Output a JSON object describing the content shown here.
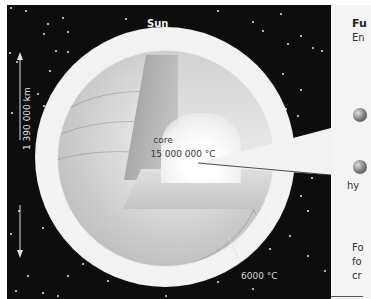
{
  "figure": {
    "title": "Sun",
    "diameter_label": "1 390 000 km",
    "core_label": "core",
    "core_temperature": "15 000 000 °C",
    "surface_temperature": "6000 °C"
  },
  "side_panel": {
    "heading_fragment": "Fu",
    "subheading_fragment": "En",
    "line_fragment_1": "hy",
    "para_fragments": [
      "Fo",
      "fo",
      "cr"
    ]
  },
  "colors": {
    "space": "#0d0d0d",
    "sun_light": "#f6f6f6",
    "sun_mid": "#c8c8c8",
    "panel": "#f4f4f4"
  }
}
